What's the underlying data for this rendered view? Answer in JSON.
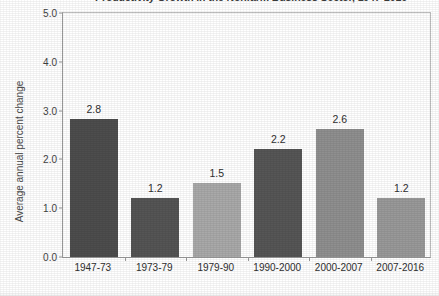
{
  "chart_data": {
    "type": "bar",
    "title": "Productivity Growth in the Nonfarm Business Sector, 1947-2016",
    "xlabel": "",
    "ylabel": "Average annual percent change",
    "categories": [
      "1947-73",
      "1973-79",
      "1979-90",
      "1990-2000",
      "2000-2007",
      "2007-2016"
    ],
    "values": [
      2.8,
      1.2,
      1.5,
      2.2,
      2.6,
      1.2
    ],
    "value_labels": [
      "2.8",
      "1.2",
      "1.5",
      "2.2",
      "2.6",
      "1.2"
    ],
    "bar_colors": [
      "#4d4d4d",
      "#555555",
      "#a9a9a9",
      "#565656",
      "#8f8f8f",
      "#999999"
    ],
    "ylim": [
      0.0,
      5.0
    ],
    "ytick_values": [
      5.0,
      4.0,
      3.0,
      2.0,
      1.0,
      0.0
    ],
    "ytick_labels": [
      "5.0",
      "4.0",
      "3.0",
      "2.0",
      "1.0",
      "0.0"
    ],
    "grid": false,
    "legend": "none"
  }
}
